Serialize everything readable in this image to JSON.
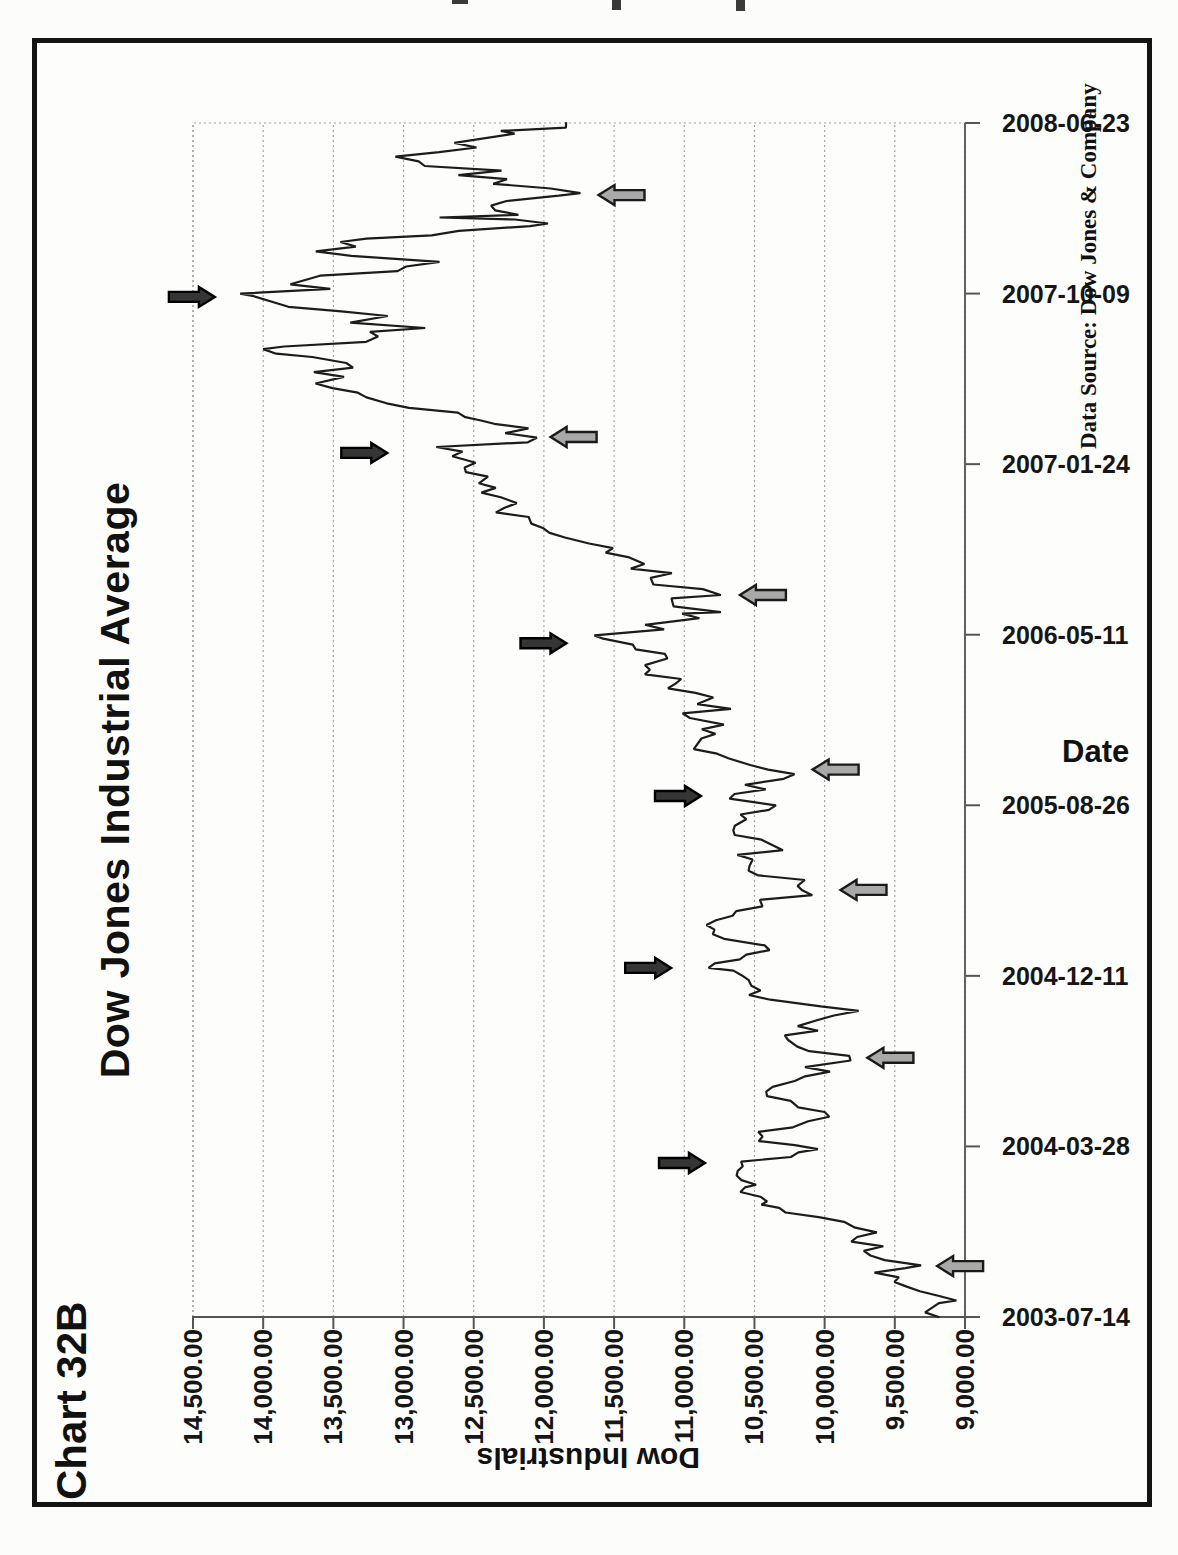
{
  "page": {
    "chart_label": "Chart 32B"
  },
  "chart_data": {
    "type": "line",
    "title": "Dow Jones Industrial Average",
    "xlabel": "Date",
    "ylabel": "Dow Industrials",
    "source_note": "Data Source:  Dow Jones & Company",
    "orientation": "landscape chart printed sideways on portrait page (rotated 90 degrees counterclockwise)",
    "x_range": [
      "2003-07-14",
      "2008-06-23"
    ],
    "x_tick_labels": [
      "2003-07-14",
      "2004-03-28",
      "2004-12-11",
      "2005-08-26",
      "2006-05-11",
      "2007-01-24",
      "2007-10-09",
      "2008-06-23"
    ],
    "ylim": [
      9000,
      14500
    ],
    "y_tick_values": [
      14500,
      14000,
      13500,
      13000,
      12500,
      12000,
      11500,
      11000,
      10500,
      10000,
      9500,
      9000
    ],
    "y_tick_labels": [
      "14,500.00",
      "14,000.00",
      "13,500.00",
      "13,000.00",
      "12,500.00",
      "12,000.00",
      "11,500.00",
      "11,000.00",
      "10,500.00",
      "10,000.00",
      "9,500.00",
      "9,000.00"
    ],
    "grid": "horizontal value gridlines every 500, dotted gray; no date gridlines; outward axis ticks",
    "legend": "none",
    "series": [
      {
        "name": "Dow Jones Industrial Average daily close",
        "points_format": "[days since 2003-07-14, index value]",
        "points": [
          [
            0,
            9188
          ],
          [
            7,
            9284
          ],
          [
            14,
            9234
          ],
          [
            21,
            9186
          ],
          [
            25,
            9061
          ],
          [
            32,
            9191
          ],
          [
            39,
            9321
          ],
          [
            46,
            9415
          ],
          [
            53,
            9503
          ],
          [
            60,
            9471
          ],
          [
            67,
            9645
          ],
          [
            74,
            9425
          ],
          [
            78,
            9313
          ],
          [
            86,
            9572
          ],
          [
            93,
            9674
          ],
          [
            100,
            9721
          ],
          [
            107,
            9582
          ],
          [
            114,
            9810
          ],
          [
            121,
            9769
          ],
          [
            128,
            9628
          ],
          [
            135,
            9782
          ],
          [
            144,
            9862
          ],
          [
            151,
            10042
          ],
          [
            158,
            10278
          ],
          [
            165,
            10324
          ],
          [
            170,
            10450
          ],
          [
            175,
            10410
          ],
          [
            182,
            10458
          ],
          [
            189,
            10600
          ],
          [
            196,
            10568
          ],
          [
            200,
            10488
          ],
          [
            207,
            10593
          ],
          [
            214,
            10627
          ],
          [
            221,
            10619
          ],
          [
            228,
            10583
          ],
          [
            235,
            10595
          ],
          [
            242,
            10240
          ],
          [
            249,
            10187
          ],
          [
            254,
            10048
          ],
          [
            260,
            10212
          ],
          [
            266,
            10470
          ],
          [
            273,
            10442
          ],
          [
            280,
            10472
          ],
          [
            287,
            10226
          ],
          [
            296,
            10117
          ],
          [
            303,
            9967
          ],
          [
            310,
            10000
          ],
          [
            317,
            10188
          ],
          [
            327,
            10242
          ],
          [
            334,
            10410
          ],
          [
            341,
            10416
          ],
          [
            348,
            10371
          ],
          [
            357,
            10213
          ],
          [
            364,
            10139
          ],
          [
            371,
            9962
          ],
          [
            378,
            10140
          ],
          [
            388,
            9815
          ],
          [
            395,
            9825
          ],
          [
            402,
            10110
          ],
          [
            409,
            10195
          ],
          [
            419,
            10260
          ],
          [
            426,
            10284
          ],
          [
            433,
            10047
          ],
          [
            440,
            10192
          ],
          [
            449,
            10055
          ],
          [
            456,
            9933
          ],
          [
            463,
            9758
          ],
          [
            470,
            10027
          ],
          [
            480,
            10387
          ],
          [
            487,
            10539
          ],
          [
            494,
            10457
          ],
          [
            501,
            10522
          ],
          [
            510,
            10543
          ],
          [
            517,
            10592
          ],
          [
            524,
            10650
          ],
          [
            528,
            10827
          ],
          [
            535,
            10783
          ],
          [
            541,
            10604
          ],
          [
            548,
            10558
          ],
          [
            555,
            10393
          ],
          [
            562,
            10427
          ],
          [
            572,
            10716
          ],
          [
            579,
            10796
          ],
          [
            586,
            10785
          ],
          [
            593,
            10842
          ],
          [
            600,
            10774
          ],
          [
            607,
            10656
          ],
          [
            614,
            10630
          ],
          [
            621,
            10443
          ],
          [
            631,
            10461
          ],
          [
            638,
            10088
          ],
          [
            645,
            10157
          ],
          [
            652,
            10193
          ],
          [
            661,
            10141
          ],
          [
            668,
            10472
          ],
          [
            675,
            10542
          ],
          [
            682,
            10535
          ],
          [
            692,
            10513
          ],
          [
            699,
            10622
          ],
          [
            706,
            10297
          ],
          [
            722,
            10450
          ],
          [
            729,
            10641
          ],
          [
            736,
            10651
          ],
          [
            743,
            10640
          ],
          [
            753,
            10558
          ],
          [
            760,
            10600
          ],
          [
            767,
            10397
          ],
          [
            774,
            10347
          ],
          [
            784,
            10678
          ],
          [
            791,
            10642
          ],
          [
            798,
            10420
          ],
          [
            805,
            10568
          ],
          [
            814,
            10292
          ],
          [
            821,
            10215
          ],
          [
            828,
            10403
          ],
          [
            835,
            10530
          ],
          [
            845,
            10686
          ],
          [
            852,
            10766
          ],
          [
            859,
            10932
          ],
          [
            875,
            10878
          ],
          [
            882,
            10778
          ],
          [
            889,
            10875
          ],
          [
            896,
            10718
          ],
          [
            906,
            10960
          ],
          [
            913,
            11012
          ],
          [
            920,
            10668
          ],
          [
            927,
            10907
          ],
          [
            937,
            10793
          ],
          [
            944,
            10920
          ],
          [
            951,
            11116
          ],
          [
            958,
            11062
          ],
          [
            965,
            11022
          ],
          [
            972,
            11280
          ],
          [
            979,
            11245
          ],
          [
            986,
            11280
          ],
          [
            996,
            11120
          ],
          [
            1003,
            11138
          ],
          [
            1010,
            11347
          ],
          [
            1017,
            11367
          ],
          [
            1026,
            11578
          ],
          [
            1031,
            11640
          ],
          [
            1040,
            11144
          ],
          [
            1047,
            11279
          ],
          [
            1057,
            10892
          ],
          [
            1064,
            11015
          ],
          [
            1066,
            10739
          ],
          [
            1075,
            11077
          ],
          [
            1087,
            11091
          ],
          [
            1092,
            10740
          ],
          [
            1101,
            10868
          ],
          [
            1108,
            11220
          ],
          [
            1118,
            11240
          ],
          [
            1125,
            11088
          ],
          [
            1132,
            11381
          ],
          [
            1139,
            11284
          ],
          [
            1149,
            11392
          ],
          [
            1156,
            11560
          ],
          [
            1163,
            11508
          ],
          [
            1170,
            11679
          ],
          [
            1179,
            11850
          ],
          [
            1186,
            11960
          ],
          [
            1193,
            12003
          ],
          [
            1200,
            12090
          ],
          [
            1210,
            12108
          ],
          [
            1217,
            12342
          ],
          [
            1224,
            12280
          ],
          [
            1231,
            12194
          ],
          [
            1240,
            12307
          ],
          [
            1247,
            12445
          ],
          [
            1254,
            12343
          ],
          [
            1261,
            12463
          ],
          [
            1271,
            12398
          ],
          [
            1278,
            12556
          ],
          [
            1285,
            12565
          ],
          [
            1292,
            12487
          ],
          [
            1302,
            12653
          ],
          [
            1309,
            12580
          ],
          [
            1316,
            12767
          ],
          [
            1323,
            12114
          ],
          [
            1330,
            12050
          ],
          [
            1337,
            12276
          ],
          [
            1344,
            12110
          ],
          [
            1351,
            12354
          ],
          [
            1356,
            12448
          ],
          [
            1361,
            12560
          ],
          [
            1368,
            12612
          ],
          [
            1375,
            12961
          ],
          [
            1382,
            13121
          ],
          [
            1391,
            13264
          ],
          [
            1398,
            13326
          ],
          [
            1405,
            13507
          ],
          [
            1412,
            13627
          ],
          [
            1422,
            13424
          ],
          [
            1429,
            13639
          ],
          [
            1436,
            13360
          ],
          [
            1443,
            13408
          ],
          [
            1452,
            13650
          ],
          [
            1457,
            13907
          ],
          [
            1464,
            14000
          ],
          [
            1468,
            13851
          ],
          [
            1475,
            13265
          ],
          [
            1483,
            13182
          ],
          [
            1490,
            13240
          ],
          [
            1496,
            12846
          ],
          [
            1504,
            13379
          ],
          [
            1514,
            13113
          ],
          [
            1521,
            13443
          ],
          [
            1528,
            13820
          ],
          [
            1544,
            14066
          ],
          [
            1548,
            14164
          ],
          [
            1555,
            13522
          ],
          [
            1562,
            13806
          ],
          [
            1575,
            13595
          ],
          [
            1582,
            13043
          ],
          [
            1589,
            12981
          ],
          [
            1596,
            12744
          ],
          [
            1605,
            13372
          ],
          [
            1612,
            13625
          ],
          [
            1619,
            13340
          ],
          [
            1626,
            13450
          ],
          [
            1631,
            13265
          ],
          [
            1636,
            12800
          ],
          [
            1643,
            12606
          ],
          [
            1650,
            12099
          ],
          [
            1654,
            11971
          ],
          [
            1660,
            12207
          ],
          [
            1663,
            12743
          ],
          [
            1667,
            12182
          ],
          [
            1674,
            12348
          ],
          [
            1681,
            12376
          ],
          [
            1688,
            12266
          ],
          [
            1696,
            11894
          ],
          [
            1700,
            11740
          ],
          [
            1707,
            11951
          ],
          [
            1714,
            12361
          ],
          [
            1721,
            12263
          ],
          [
            1727,
            12609
          ],
          [
            1734,
            12302
          ],
          [
            1741,
            12849
          ],
          [
            1748,
            12892
          ],
          [
            1755,
            13058
          ],
          [
            1762,
            12746
          ],
          [
            1769,
            12480
          ],
          [
            1776,
            12638
          ],
          [
            1790,
            12209
          ],
          [
            1794,
            12307
          ],
          [
            1799,
            11843
          ],
          [
            1806,
            11842
          ]
        ]
      }
    ],
    "arrows": [
      {
        "date": "2007-10-04",
        "tip_value": 14344,
        "dir": "down",
        "shade": "dark",
        "marks": "October 2007 market top"
      },
      {
        "date": "2007-02-10",
        "tip_value": 13116,
        "dir": "down",
        "shade": "dark",
        "marks": "February 2007 top"
      },
      {
        "date": "2006-04-28",
        "tip_value": 11839,
        "dir": "down",
        "shade": "dark",
        "marks": "May 2006 top"
      },
      {
        "date": "2005-09-09",
        "tip_value": 10881,
        "dir": "down",
        "shade": "dark",
        "marks": "September 2005 top"
      },
      {
        "date": "2004-12-23",
        "tip_value": 11093,
        "dir": "down",
        "shade": "dark",
        "marks": "December 2004 top"
      },
      {
        "date": "2004-03-03",
        "tip_value": 10852,
        "dir": "down",
        "shade": "dark",
        "marks": "early 2004 top"
      },
      {
        "date": "2003-09-29",
        "tip_value": 9199,
        "dir": "up",
        "shade": "gray",
        "marks": "September 2003 bottom"
      },
      {
        "date": "2004-08-09",
        "tip_value": 9695,
        "dir": "up",
        "shade": "gray",
        "marks": "August 2004 bottom"
      },
      {
        "date": "2005-04-20",
        "tip_value": 9887,
        "dir": "up",
        "shade": "gray",
        "marks": "April 2005 bottom"
      },
      {
        "date": "2005-10-19",
        "tip_value": 10086,
        "dir": "up",
        "shade": "gray",
        "marks": "October 2005 bottom"
      },
      {
        "date": "2006-07-10",
        "tip_value": 10604,
        "dir": "up",
        "shade": "gray",
        "marks": "July 2006 bottom"
      },
      {
        "date": "2007-03-06",
        "tip_value": 11952,
        "dir": "up",
        "shade": "gray",
        "marks": "March 2007 bottom"
      },
      {
        "date": "2008-03-06",
        "tip_value": 11611,
        "dir": "up",
        "shade": "gray",
        "marks": "March 2008 bottom"
      }
    ],
    "colors": {
      "line": "#1c1c1c",
      "dark_arrow_fill": "#353535",
      "dark_arrow_stroke": "#000000",
      "gray_arrow_fill": "#a9a9a9",
      "gray_arrow_stroke": "#1a1a1a",
      "gridline": "#9f9f9f",
      "axis": "#555555",
      "frame": "#141414",
      "paper": "#fdfdfb",
      "text": "#111111"
    }
  }
}
